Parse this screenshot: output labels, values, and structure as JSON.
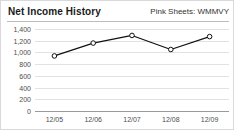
{
  "header": {
    "title": "Net Income History",
    "ticker": "Pink Sheets: WMMVY"
  },
  "chart_data": {
    "type": "line",
    "title": "Net Income History",
    "subtitle": "Pink Sheets: WMMVY",
    "xlabel": "",
    "ylabel": "",
    "categories": [
      "12/05",
      "12/06",
      "12/07",
      "12/08",
      "12/09"
    ],
    "values": [
      940,
      1160,
      1290,
      1050,
      1270
    ],
    "ylim": [
      0,
      1400
    ],
    "ytick_labels": [
      "1,400",
      "1,200",
      "1,000",
      "800",
      "600",
      "400",
      "200",
      "0"
    ],
    "ytick_values": [
      1400,
      1200,
      1000,
      800,
      600,
      400,
      200,
      0
    ],
    "grid": true,
    "legend": "none",
    "marker": "open-circle",
    "line_color": "#111111",
    "grid_color": "#e2e2e2",
    "axis_color": "#9a9a9a"
  }
}
